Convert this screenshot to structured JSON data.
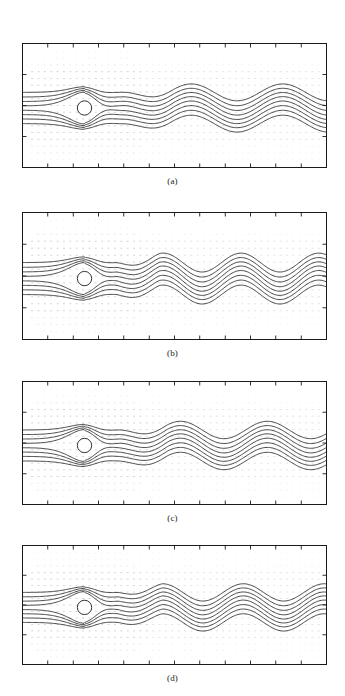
{
  "figure": {
    "type": "multi-panel-flow-visualization",
    "background_color": "#ffffff",
    "line_color": "#1a1a1a",
    "grid_dot_color": "#b9b9b9",
    "panel_count": 4,
    "panels": [
      {
        "id": "panel-a",
        "caption": "(a)",
        "box": {
          "x": 22,
          "y": 43,
          "width": 305,
          "height": 125
        },
        "caption_y": 176
      },
      {
        "id": "panel-b",
        "caption": "(b)",
        "box": {
          "x": 22,
          "y": 212,
          "width": 305,
          "height": 128
        },
        "caption_y": 348
      },
      {
        "id": "panel-c",
        "caption": "(c)",
        "box": {
          "x": 22,
          "y": 381,
          "width": 305,
          "height": 124
        },
        "caption_y": 513
      },
      {
        "id": "panel-d",
        "caption": "(d)",
        "box": {
          "x": 22,
          "y": 545,
          "width": 305,
          "height": 120
        },
        "caption_y": 673
      }
    ]
  },
  "chart_data": {
    "type": "line",
    "title": "",
    "subtitle": "",
    "xlabel": "",
    "ylabel": "",
    "grid": false,
    "legend": "none",
    "axes": {
      "x_range": [
        0,
        1
      ],
      "y_range": [
        0,
        1
      ],
      "x_ticks_visible": true,
      "y_ticks_visible": true,
      "tick_side": "inward",
      "x_tick_positions": [
        0.0,
        0.083,
        0.167,
        0.25,
        0.333,
        0.417,
        0.5,
        0.583,
        0.667,
        0.75,
        0.833,
        0.917,
        1.0
      ],
      "y_tick_positions": [
        0.0,
        0.25,
        0.5,
        0.75,
        1.0
      ]
    },
    "cylinder": {
      "cx_frac": 0.205,
      "cy_frac": 0.52,
      "r_frac_x": 0.0235,
      "fill": "#ffffff",
      "stroke": "#1a1a1a"
    },
    "streamline_count": 8,
    "inlet_y_fracs": [
      0.395,
      0.432,
      0.468,
      0.503,
      0.538,
      0.573,
      0.608,
      0.645
    ],
    "series": [
      {
        "name": "panel-a-wake",
        "wave_amplitude_frac": 0.075,
        "wave_wavelength_frac": 0.3,
        "wave_start_frac": 0.33,
        "wave_phase": 0.0,
        "wave_cycles": 2.2
      },
      {
        "name": "panel-b-wake",
        "wave_amplitude_frac": 0.082,
        "wave_wavelength_frac": 0.255,
        "wave_start_frac": 0.31,
        "wave_phase": 0.15,
        "wave_cycles": 2.7
      },
      {
        "name": "panel-c-wake",
        "wave_amplitude_frac": 0.078,
        "wave_wavelength_frac": 0.285,
        "wave_start_frac": 0.32,
        "wave_phase": 0.05,
        "wave_cycles": 2.4
      },
      {
        "name": "panel-d-wake",
        "wave_amplitude_frac": 0.08,
        "wave_wavelength_frac": 0.265,
        "wave_start_frac": 0.315,
        "wave_phase": 0.2,
        "wave_cycles": 2.6
      }
    ],
    "dot_grid": {
      "cols": 46,
      "rows": 17,
      "color": "#b9b9b9",
      "note": "faint dotted velocity vector field covering the panel interior, denser near the cylinder"
    }
  }
}
